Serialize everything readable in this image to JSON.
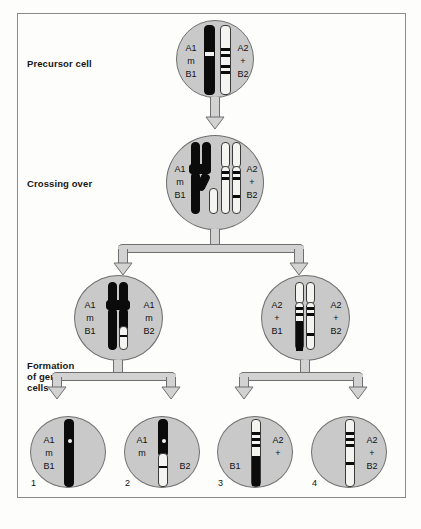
{
  "diagram": {
    "title_labels": {
      "precursor": "Precursor cell",
      "crossing_over": "Crossing over",
      "formation_line1": "Formation",
      "formation_line2": "of germ",
      "formation_line3": "cells"
    },
    "precursor_cell": {
      "left_alleles": [
        "A1",
        "m",
        "B1"
      ],
      "right_alleles": [
        "A2",
        "+",
        "B2"
      ]
    },
    "crossing_over_cell": {
      "left_alleles": [
        "A1",
        "m",
        "B1"
      ],
      "right_alleles": [
        "A2",
        "+",
        "B2"
      ]
    },
    "secondary_cells": [
      {
        "position": "left",
        "left_alleles": [
          "A1",
          "m",
          "B1"
        ],
        "right_alleles": [
          "A1",
          "m",
          "B2"
        ]
      },
      {
        "position": "right",
        "left_alleles": [
          "A2",
          "+",
          "B1"
        ],
        "right_alleles": [
          "A2",
          "+",
          "B2"
        ]
      }
    ],
    "germ_cells": [
      {
        "number": "1",
        "left_alleles": [
          "A1",
          "m",
          "B1"
        ],
        "right_alleles": []
      },
      {
        "number": "2",
        "left_alleles": [
          "A1",
          "m"
        ],
        "right_alleles": [
          "B2"
        ]
      },
      {
        "number": "3",
        "left_alleles": [
          "B1"
        ],
        "right_alleles": [
          "A2",
          "+"
        ]
      },
      {
        "number": "4",
        "left_alleles": [],
        "right_alleles": [
          "A2",
          "+",
          "B2"
        ]
      }
    ],
    "colors": {
      "cell_fill": "#c9c9c9",
      "cell_stroke": "#6f6f6f",
      "chromosome_dark": "#0b0b0b",
      "chromosome_light": "#f4f4f0",
      "arrow_fill": "#d2d2d2",
      "frame_stroke": "#8b8b86",
      "text": "#111111"
    }
  }
}
